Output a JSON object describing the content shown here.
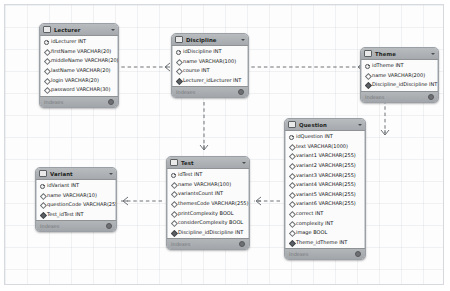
{
  "diagram": {
    "tool": "eer-diagram",
    "footer_label": "Indexes",
    "colors": {
      "canvas": "#fdfdfd",
      "table_header": "#a6a9ad",
      "table_body": "#fbfbfb",
      "table_border": "#9aa0a6",
      "connector": "#6e7377"
    }
  },
  "tables": [
    {
      "name": "Lecturer",
      "x": 34,
      "y": 18,
      "w": 80,
      "fields": [
        {
          "label": "idLecturer INT",
          "key": "pk"
        },
        {
          "label": "firstName VARCHAR(20)",
          "key": "col"
        },
        {
          "label": "middleName VARCHAR(20)",
          "key": "col"
        },
        {
          "label": "lastName VARCHAR(20)",
          "key": "col"
        },
        {
          "label": "login VARCHAR(20)",
          "key": "col"
        },
        {
          "label": "password VARCHAR(30)",
          "key": "col"
        }
      ]
    },
    {
      "name": "Discipline",
      "x": 166,
      "y": 28,
      "w": 78,
      "fields": [
        {
          "label": "idDiscipline INT",
          "key": "pk"
        },
        {
          "label": "name VARCHAR(100)",
          "key": "col"
        },
        {
          "label": "course INT",
          "key": "col"
        },
        {
          "label": "Lecturer_idLecturer INT",
          "key": "fk"
        }
      ]
    },
    {
      "name": "Theme",
      "x": 355,
      "y": 42,
      "w": 79,
      "fields": [
        {
          "label": "idTheme INT",
          "key": "pk"
        },
        {
          "label": "name VARCHAR(200)",
          "key": "col"
        },
        {
          "label": "Discipline_idDiscipline INT",
          "key": "fk"
        }
      ]
    },
    {
      "name": "Question",
      "x": 279,
      "y": 113,
      "w": 82,
      "fields": [
        {
          "label": "idQuestion INT",
          "key": "pk"
        },
        {
          "label": "text VARCHAR(1000)",
          "key": "col"
        },
        {
          "label": "variant1 VARCHAR(255)",
          "key": "col"
        },
        {
          "label": "variant2 VARCHAR(255)",
          "key": "col"
        },
        {
          "label": "variant3 VARCHAR(255)",
          "key": "col"
        },
        {
          "label": "variant4 VARCHAR(255)",
          "key": "col"
        },
        {
          "label": "variant5 VARCHAR(255)",
          "key": "col"
        },
        {
          "label": "variant6 VARCHAR(255)",
          "key": "col"
        },
        {
          "label": "correct INT",
          "key": "col"
        },
        {
          "label": "complexity INT",
          "key": "col"
        },
        {
          "label": "image BOOL",
          "key": "col"
        },
        {
          "label": "Theme_idTheme INT",
          "key": "fk"
        }
      ]
    },
    {
      "name": "Test",
      "x": 161,
      "y": 151,
      "w": 84,
      "fields": [
        {
          "label": "idTest INT",
          "key": "pk"
        },
        {
          "label": "name VARCHAR(100)",
          "key": "col"
        },
        {
          "label": "variantsCount INT",
          "key": "col"
        },
        {
          "label": "themesCode VARCHAR(255)",
          "key": "col"
        },
        {
          "label": "printComplexity BOOL",
          "key": "col"
        },
        {
          "label": "considerComplexity BOOL",
          "key": "col"
        },
        {
          "label": "Discipline_idDiscipline INT",
          "key": "fk"
        }
      ]
    },
    {
      "name": "Variant",
      "x": 30,
      "y": 162,
      "w": 82,
      "fields": [
        {
          "label": "idVariant INT",
          "key": "pk"
        },
        {
          "label": "name VARCHAR(10)",
          "key": "col"
        },
        {
          "label": "questionCode VARCHAR(255)",
          "key": "col"
        },
        {
          "label": "Test_idTest INT",
          "key": "fk"
        }
      ]
    }
  ],
  "relationships": [
    {
      "from": "Lecturer",
      "to": "Discipline",
      "label": ""
    },
    {
      "from": "Discipline",
      "to": "Theme",
      "label": ""
    },
    {
      "from": "Discipline",
      "to": "Test",
      "label": ""
    },
    {
      "from": "Theme",
      "to": "Question",
      "label": ""
    },
    {
      "from": "Question",
      "to": "Test",
      "label": ""
    },
    {
      "from": "Test",
      "to": "Variant",
      "label": ""
    }
  ]
}
